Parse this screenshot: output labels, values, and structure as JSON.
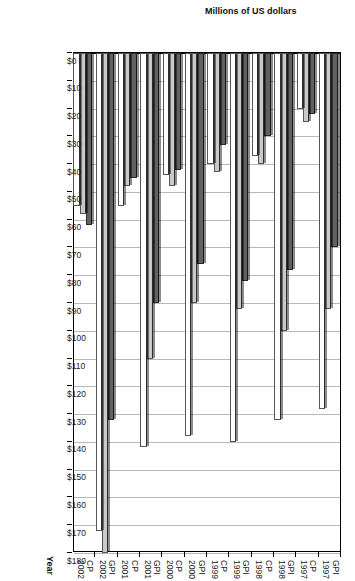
{
  "chart_data": {
    "type": "bar",
    "title": "",
    "orientation": "horizontal",
    "xlabel": "Year",
    "ylabel": "Millions of US dollars",
    "categories": [
      "GPI 1997",
      "CP 1997",
      "GPI 1998",
      "CP 1998",
      "GPI 1999",
      "CP 1999",
      "GPI 2000",
      "CP 2000",
      "GPI 2001",
      "CP 2001",
      "GPI 2002",
      "CP 2002"
    ],
    "category_lines": [
      [
        "GPI",
        "1997"
      ],
      [
        "CP",
        "1997"
      ],
      [
        "GPI",
        "1998"
      ],
      [
        "CP",
        "1998"
      ],
      [
        "GPI",
        "1999"
      ],
      [
        "CP",
        "1999"
      ],
      [
        "GPI",
        "2000"
      ],
      [
        "CP",
        "2000"
      ],
      [
        "GPI",
        "2001"
      ],
      [
        "CP",
        "2001"
      ],
      [
        "GPI",
        "2002"
      ],
      [
        "CP",
        "2002"
      ]
    ],
    "series": [
      {
        "name": "series-1",
        "color": "#616161",
        "values": [
          70,
          22,
          78,
          30,
          82,
          33,
          76,
          42,
          90,
          45,
          132,
          62
        ]
      },
      {
        "name": "series-2",
        "color": "#c9c9c9",
        "values": [
          92,
          25,
          100,
          40,
          92,
          43,
          90,
          48,
          110,
          48,
          180,
          58
        ]
      },
      {
        "name": "series-3",
        "color": "#ffffff",
        "values": [
          128,
          20,
          132,
          37,
          140,
          40,
          138,
          44,
          142,
          55,
          172,
          55
        ]
      }
    ],
    "ylim": [
      0,
      180
    ],
    "ytick_step": 10,
    "ytick_labels": [
      "$0",
      "$10",
      "$20",
      "$30",
      "$40",
      "$50",
      "$60",
      "$70",
      "$80",
      "$90",
      "$100",
      "$110",
      "$120",
      "$130",
      "$140",
      "$150",
      "$160",
      "$170",
      "$180"
    ],
    "grid": true,
    "legend": "none"
  }
}
